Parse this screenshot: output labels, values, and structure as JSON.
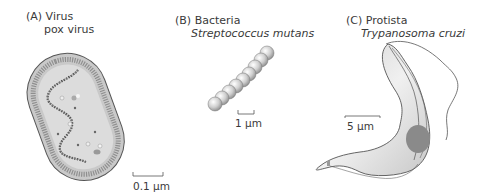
{
  "panels": [
    {
      "letter": "(A)",
      "category": "Virus",
      "organism": "pox virus",
      "scale_bar": "0.1 µm"
    },
    {
      "letter": "(B)",
      "category": "Bacteria",
      "organism": "Streptococcus mutans",
      "scale_bar": "1 µm"
    },
    {
      "letter": "(C)",
      "category": "Protista",
      "organism": "Trypanosoma cruzi",
      "scale_bar": "5 µm"
    }
  ],
  "colors": {
    "outer": "#c9c9c9",
    "inner": "#dcdcdc",
    "outline": "#555555",
    "membrane": "#8f8f8f",
    "nucleus": "#8a8a8a",
    "sphere": "#cfcfcf"
  }
}
